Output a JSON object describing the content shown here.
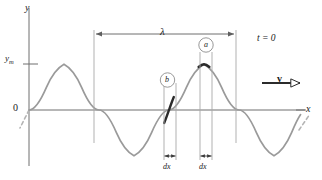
{
  "figure": {
    "axes": {
      "y_label": "y",
      "x_label": "x",
      "origin_label": "0",
      "amplitude_label": "y",
      "amplitude_subscript": "m"
    },
    "annotations": {
      "wavelength_label": "λ",
      "time_label": "t = 0",
      "velocity_label": "v",
      "element_a_label": "a",
      "element_b_label": "b",
      "dx_label_b": "dx",
      "dx_label_a": "dx"
    },
    "colors": {
      "curve": "#9a9a9a",
      "curve_highlight": "#2b2b2b",
      "axis": "#6e6e6e",
      "guide_line": "#a8a8a8",
      "text": "#1a1a1a",
      "background": "#ffffff",
      "vector": "#2b2b2b"
    },
    "geometry": {
      "origin_x": 29,
      "baseline_y": 110,
      "amplitude_px": 46,
      "wavelength_px": 142,
      "lambda_left_x": 94,
      "lambda_right_x": 236,
      "element_a_center_x": 207,
      "element_b_center_x": 170,
      "dx_width_px": 12
    }
  }
}
